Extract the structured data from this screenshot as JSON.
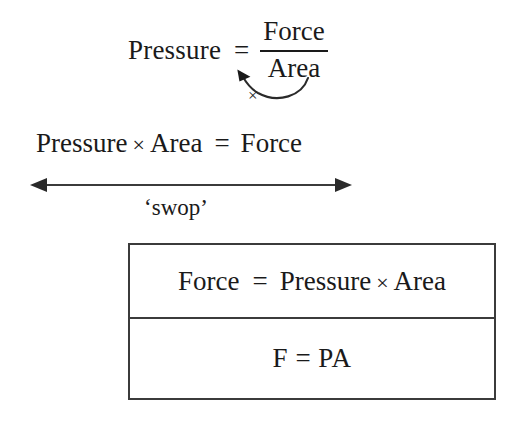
{
  "diagram": {
    "colors": {
      "ink": "#1a1a1a",
      "box_border": "#3b3b3b",
      "background": "#ffffff",
      "arrow": "#3b3b3b"
    },
    "equation_fraction": {
      "left_term": "Pressure",
      "equals": "=",
      "numerator": "Force",
      "denominator": "Area"
    },
    "curved_arrow": {
      "operator_label": "×",
      "meaning": "multiply-both-sides-by-area"
    },
    "equation_product": {
      "term1": "Pressure",
      "operator": "×",
      "term2": "Area",
      "equals": "=",
      "result": "Force"
    },
    "swop": {
      "label": "‘swop’",
      "arrow": "double-headed-horizontal"
    },
    "result_box": {
      "row_words": {
        "left": "Force",
        "equals": "=",
        "term1": "Pressure",
        "operator": "×",
        "term2": "Area"
      },
      "row_symbols": {
        "text": "F  =  PA"
      }
    }
  }
}
